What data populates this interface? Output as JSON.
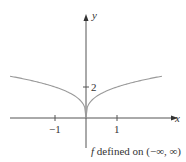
{
  "chart_data": {
    "type": "line",
    "title": "",
    "caption": "f defined on (−∞, ∞)",
    "caption_f": "f",
    "caption_rest": " defined on (−∞, ∞)",
    "xlabel": "x",
    "ylabel": "y",
    "x_ticks": [
      -1,
      1
    ],
    "x_tick_labels": [
      "−1",
      "1"
    ],
    "y_ticks": [
      2
    ],
    "y_tick_labels": [
      "2"
    ],
    "xlim": [
      -2.5,
      2.9
    ],
    "ylim": [
      -1.0,
      3.4
    ],
    "grid": false,
    "legend": null,
    "series": [
      {
        "name": "f(x)",
        "description": "cusp at origin, increasing in |x| (approx. 2|x|^(1/3))",
        "color": "#9a9a9a",
        "x": [
          -2.45,
          -2.0,
          -1.5,
          -1.0,
          -0.5,
          -0.25,
          -0.1,
          0,
          0.1,
          0.25,
          0.5,
          1.0,
          1.5,
          2.0,
          2.45
        ],
        "y": [
          2.7,
          2.52,
          2.29,
          2.0,
          1.59,
          1.26,
          0.93,
          0,
          0.93,
          1.26,
          1.59,
          2.0,
          2.29,
          2.52,
          2.7
        ]
      }
    ]
  },
  "colors": {
    "axis": "#555555",
    "curve": "#9a9a9a",
    "text": "#333333"
  }
}
